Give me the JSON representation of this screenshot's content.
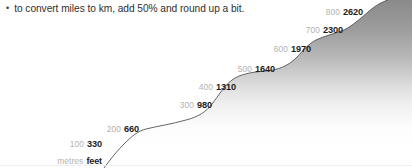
{
  "note": {
    "bullet_glyph": "•",
    "text": "to convert miles to km, add 50% and round up a bit."
  },
  "chart_data": {
    "type": "line",
    "title": "",
    "subtitle": "",
    "xlabel": "",
    "ylabel": "",
    "grid": false,
    "legend": null,
    "axis_header": {
      "metres": "metres",
      "feet": "feet"
    },
    "series": [
      {
        "name": "metres",
        "values": [
          100,
          200,
          300,
          400,
          500,
          600,
          700,
          800
        ]
      },
      {
        "name": "feet",
        "values": [
          330,
          660,
          980,
          1310,
          1640,
          1970,
          2300,
          2620
        ]
      }
    ],
    "points": [
      {
        "metres": "100",
        "feet": "330",
        "x": 104,
        "y": 143
      },
      {
        "metres": "200",
        "feet": "660",
        "x": 141,
        "y": 128
      },
      {
        "metres": "300",
        "feet": "980",
        "x": 214,
        "y": 104
      },
      {
        "metres": "400",
        "feet": "1310",
        "x": 238,
        "y": 86
      },
      {
        "metres": "500",
        "feet": "1640",
        "x": 277,
        "y": 68
      },
      {
        "metres": "600",
        "feet": "1970",
        "x": 313,
        "y": 48
      },
      {
        "metres": "700",
        "feet": "2300",
        "x": 345,
        "y": 29
      },
      {
        "metres": "800",
        "feet": "2620",
        "x": 365,
        "y": 11
      }
    ],
    "axis_anchor": {
      "x": 104,
      "y": 160
    },
    "curve_path": "M 104 168 C 110 160 116 152 124 144 C 132 136 138 131 146 129 C 158 126 172 124 186 120 C 198 117 206 112 212 104 C 219 95 224 86 232 80 C 240 74 252 72 266 71 C 278 70 288 66 296 58 C 303 51 308 44 316 40 C 324 36 334 34 344 30 C 352 26 360 19 368 12 C 376 5 382 2 388 0",
    "fill_path": "M 104 168 C 110 160 116 152 124 144 C 132 136 138 131 146 129 C 158 126 172 124 186 120 C 198 117 206 112 212 104 C 219 95 224 86 232 80 C 240 74 252 72 266 71 C 278 70 288 66 296 58 C 303 51 308 44 316 40 C 324 36 334 34 344 30 C 352 26 360 19 368 12 C 376 5 382 2 388 0 L 412 0 L 412 168 Z",
    "colors": {
      "curve_stroke": "#555555",
      "fill_top": "#8a8a8a",
      "fill_bottom": "#ffffff",
      "metres_label": "#b2b2b2",
      "feet_label": "#1d1d1d",
      "note_text": "#2f2f2f",
      "background": "#ffffff"
    }
  }
}
